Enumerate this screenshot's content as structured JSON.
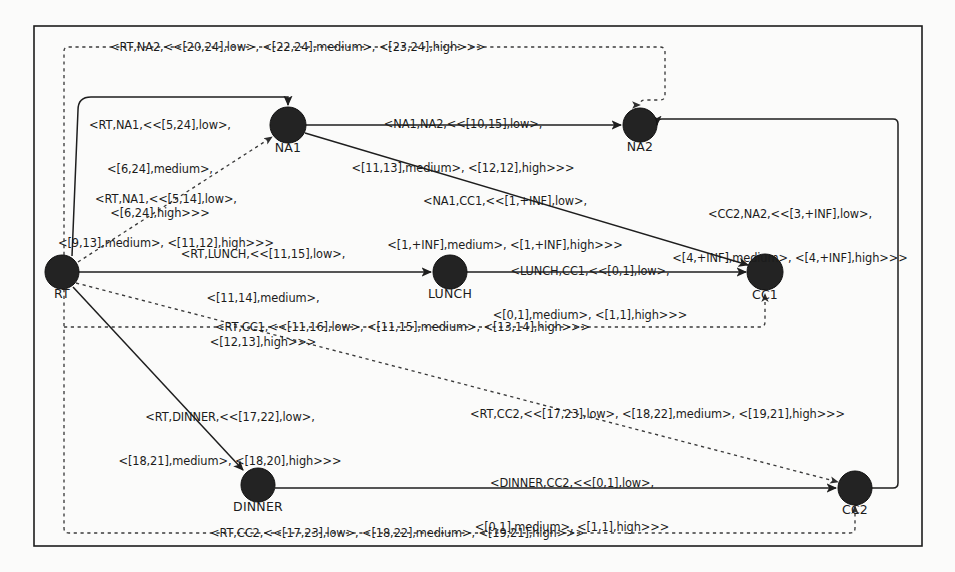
{
  "diagram": {
    "background_color": "#fbfbfa",
    "node_color": "#232323",
    "edge_color": "#1e1e1e",
    "nodes": [
      {
        "id": "RT",
        "label": "RT",
        "cx": 62,
        "cy": 272,
        "r": 17
      },
      {
        "id": "NA1",
        "label": "NA1",
        "cx": 288,
        "cy": 125,
        "r": 18
      },
      {
        "id": "NA2",
        "label": "NA2",
        "cx": 640,
        "cy": 125,
        "r": 17
      },
      {
        "id": "LUNCH",
        "label": "LUNCH",
        "cx": 450,
        "cy": 272,
        "r": 17
      },
      {
        "id": "CC1",
        "label": "CC1",
        "cx": 765,
        "cy": 272,
        "r": 18
      },
      {
        "id": "DINNER",
        "label": "DINNER",
        "cx": 258,
        "cy": 485,
        "r": 17
      },
      {
        "id": "CC2",
        "label": "CC2",
        "cx": 855,
        "cy": 488,
        "r": 17
      }
    ],
    "edges": [
      {
        "id": "rt-na2",
        "from": "RT",
        "to": "NA2",
        "style": "dashed",
        "label": "<RT,NA2,<<[20,24],low>, <[22,24],medium>, <[23,24],high>>>"
      },
      {
        "id": "rt-na1-solid",
        "from": "RT",
        "to": "NA1",
        "style": "solid",
        "label_lines": [
          "<RT,NA1,<<[5,24],low>,",
          "<[6,24],medium>,",
          "<[6,24],high>>>"
        ]
      },
      {
        "id": "na1-na2",
        "from": "NA1",
        "to": "NA2",
        "style": "solid",
        "label_lines": [
          "<NA1,NA2,<<[10,15],low>,",
          "<[11,13],medium>, <[12,12],high>>>"
        ]
      },
      {
        "id": "rt-na1-dashed",
        "from": "RT",
        "to": "NA1",
        "style": "dashed",
        "label_lines": [
          "<RT,NA1,<<[5,14],low>,",
          "<[9,13],medium>, <[11,12],high>>>"
        ]
      },
      {
        "id": "na1-cc1",
        "from": "NA1",
        "to": "CC1",
        "style": "solid",
        "label_lines": [
          "<NA1,CC1,<<[1,+INF],low>,",
          "<[1,+INF],medium>, <[1,+INF],high>>>"
        ]
      },
      {
        "id": "cc2-na2",
        "from": "CC2",
        "to": "NA2",
        "style": "solid",
        "label_lines": [
          "<CC2,NA2,<<[3,+INF],low>,",
          "<[4,+INF],medium>, <[4,+INF],high>>>"
        ]
      },
      {
        "id": "rt-lunch",
        "from": "RT",
        "to": "LUNCH",
        "style": "solid",
        "label_lines": [
          "<RT,LUNCH,<<[11,15],low>,",
          "<[11,14],medium>,",
          "<[12,13],high>>>"
        ]
      },
      {
        "id": "lunch-cc1",
        "from": "LUNCH",
        "to": "CC1",
        "style": "solid",
        "label_lines": [
          "<LUNCH,CC1,<<[0,1],low>,",
          "<[0,1],medium>, <[1,1],high>>>"
        ]
      },
      {
        "id": "rt-cc1",
        "from": "RT",
        "to": "CC1",
        "style": "dashed",
        "label": "<RT,CC1,<<[11,16],low>, <[11,15],medium>, <[13,14],high>>>"
      },
      {
        "id": "rt-dinner",
        "from": "RT",
        "to": "DINNER",
        "style": "solid",
        "label_lines": [
          "<RT,DINNER,<<[17,22],low>,",
          "<[18,21],medium>, <[18,20],high>>>"
        ]
      },
      {
        "id": "rt-cc2-diagonal",
        "from": "RT",
        "to": "CC2",
        "style": "dashed",
        "label": "<RT,CC2,<<[17,23],low>, <[18,22],medium>, <[19,21],high>>>"
      },
      {
        "id": "dinner-cc2",
        "from": "DINNER",
        "to": "CC2",
        "style": "solid",
        "label_lines": [
          "<DINNER,CC2,<<[0,1],low>,",
          "<[0,1],medium>, <[1,1],high>>>"
        ]
      },
      {
        "id": "rt-cc2-bottom",
        "from": "RT",
        "to": "CC2",
        "style": "dashed",
        "label": "<RT,CC2,<<[17,23],low>, <[18,22],medium>, <[19,21],high>>>"
      }
    ]
  }
}
